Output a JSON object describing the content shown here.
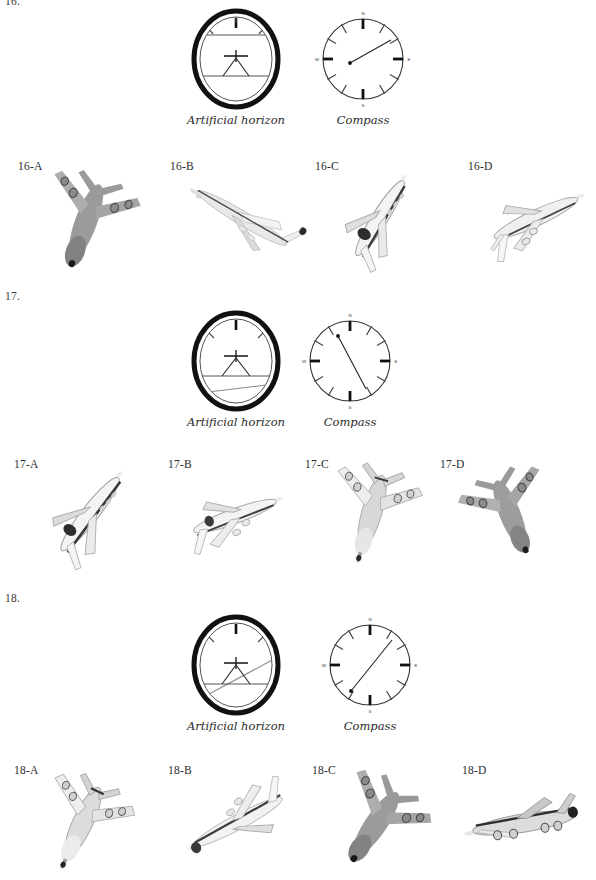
{
  "page": {
    "background": "#ffffff",
    "ink": "#231f20"
  },
  "instrument_labels": {
    "artificial_horizon": "Artificial horizon",
    "compass": "Compass",
    "compass_north": "N",
    "compass_south": "S",
    "compass_east": "E",
    "compass_west": "W"
  },
  "questions": [
    {
      "number": "16.",
      "id": "q16",
      "instruments": {
        "artificial_horizon": {
          "bank_angle_deg": 0,
          "pitch_offset": 0,
          "horizon_description": "level horizon, no bank, no pitch"
        },
        "compass": {
          "heading_deg": 68,
          "needle_description": "needle points toward ENE (upper right), tail dot at left of centre"
        }
      },
      "options": [
        {
          "label": "16-A",
          "plane": "a"
        },
        {
          "label": "16-B",
          "plane": "b"
        },
        {
          "label": "16-C",
          "plane": "c"
        },
        {
          "label": "16-D",
          "plane": "d"
        }
      ]
    },
    {
      "number": "17.",
      "id": "q17",
      "instruments": {
        "artificial_horizon": {
          "bank_angle_deg": -7,
          "pitch_offset": 14,
          "horizon_description": "horizon line low and tilted slightly, nose-up climbing attitude"
        },
        "compass": {
          "heading_deg": 340,
          "needle_description": "needle from lower right (SE) to upper left (NNW), head dot at upper left"
        }
      },
      "options": [
        {
          "label": "17-A",
          "plane": "e"
        },
        {
          "label": "17-B",
          "plane": "f"
        },
        {
          "label": "17-C",
          "plane": "g"
        },
        {
          "label": "17-D",
          "plane": "h"
        }
      ]
    },
    {
      "number": "18.",
      "id": "q18",
      "instruments": {
        "artificial_horizon": {
          "bank_angle_deg": -17,
          "pitch_offset": 6,
          "horizon_description": "horizon line tilted from lower left to upper right, banked left"
        },
        "compass": {
          "heading_deg": 42,
          "needle_description": "needle from lower left (SW) to upper right (NE), head dot at lower left"
        }
      },
      "options": [
        {
          "label": "18-A",
          "plane": "i"
        },
        {
          "label": "18-B",
          "plane": "j"
        },
        {
          "label": "18-C",
          "plane": "k"
        },
        {
          "label": "18-D",
          "plane": "l"
        }
      ]
    }
  ]
}
